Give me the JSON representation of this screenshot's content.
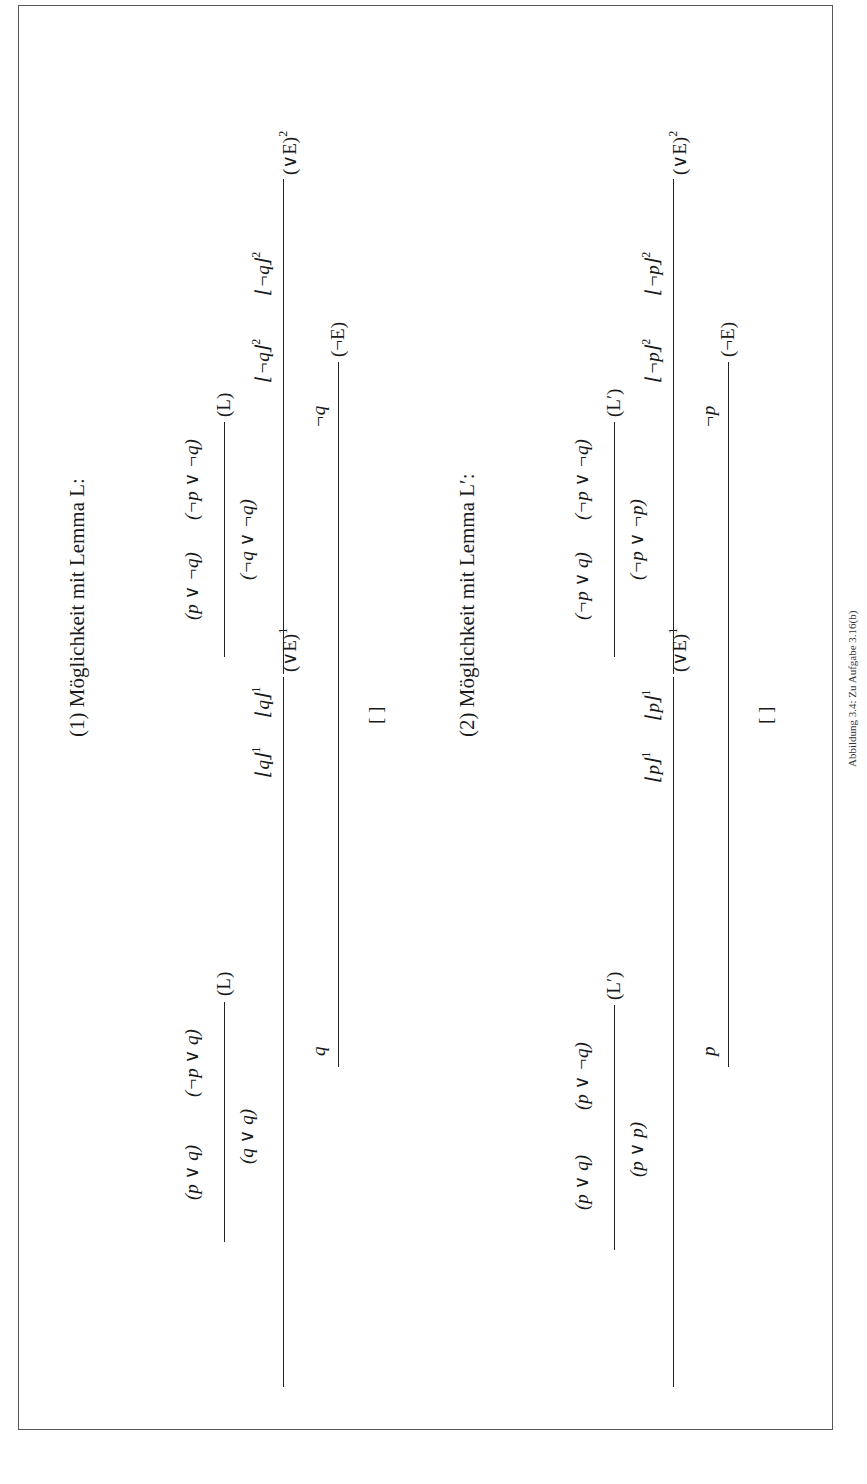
{
  "figure": {
    "caption": "Abbildung 3.4: Zu Aufgabe 3.16(b)",
    "proofs": [
      {
        "heading": "(1) Möglichkeit mit Lemma L:",
        "left_branch": {
          "premises": [
            "(p ∨ q)",
            "(¬p ∨ q)"
          ],
          "rule1": "(L)",
          "conclusion1": "(q ∨ q)",
          "assumptions": [
            "⌊q⌋",
            "⌊q⌋"
          ],
          "assumption_index": "1",
          "rule2": "(∨E)",
          "rule2_index": "1",
          "conclusion2": "q"
        },
        "right_branch": {
          "premises": [
            "(p ∨ ¬q)",
            "(¬p ∨ ¬q)"
          ],
          "rule1": "(L)",
          "conclusion1": "(¬q ∨ ¬q)",
          "assumptions": [
            "⌊¬q⌋",
            "⌊¬q⌋"
          ],
          "assumption_index": "2",
          "rule2": "(∨E)",
          "rule2_index": "2",
          "conclusion2": "¬q"
        },
        "final_rule": "(¬E)",
        "final_conclusion": "[ ]"
      },
      {
        "heading": "(2) Möglichkeit mit Lemma L′:",
        "left_branch": {
          "premises": [
            "(p ∨ q)",
            "(p ∨ ¬q)"
          ],
          "rule1": "(L′)",
          "conclusion1": "(p ∨ p)",
          "assumptions": [
            "⌊p⌋",
            "⌊p⌋"
          ],
          "assumption_index": "1",
          "rule2": "(∨E)",
          "rule2_index": "1",
          "conclusion2": "p"
        },
        "right_branch": {
          "premises": [
            "(¬p ∨ q)",
            "(¬p ∨ ¬q)"
          ],
          "rule1": "(L′)",
          "conclusion1": "(¬p ∨ ¬p)",
          "assumptions": [
            "⌊¬p⌋",
            "⌊¬p⌋"
          ],
          "assumption_index": "2",
          "rule2": "(∨E)",
          "rule2_index": "2",
          "conclusion2": "¬p"
        },
        "final_rule": "(¬E)",
        "final_conclusion": "[ ]"
      }
    ]
  }
}
